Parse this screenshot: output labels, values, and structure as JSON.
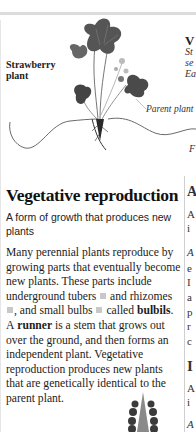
{
  "figure": {
    "plant_label_line1": "Strawberry",
    "plant_label_line2": "plant",
    "parent_label": "Parent plant",
    "icon": "strawberry-plant-illustration"
  },
  "right_peek": {
    "heading_char": "V",
    "italic_lines": [
      "St",
      "se",
      "Ea"
    ],
    "F": "F",
    "col_chars": [
      "A",
      "A",
      "i",
      "A",
      "e",
      "I",
      "a",
      "p",
      "r",
      "c",
      "I",
      "A",
      "i",
      "A"
    ]
  },
  "section": {
    "title": "Vegetative reproduction",
    "subtitle": "A form of growth that produces new plants",
    "body": {
      "p1": "Many perennial plants reproduce by growing parts that eventually become new plants. These parts include underground tubers",
      "p2": "and rhizomes",
      "p3": ", and small bulbs",
      "p4": "called",
      "bulbils": "bulbils",
      "p5": ". A",
      "runner": "runner",
      "p6": "is a stem that grows out over the ground, and then forms an independent plant. Vegetative reproduction produces new plants that are genetically identical to the parent plant."
    }
  },
  "colors": {
    "topbar": "#dcdcdc",
    "square_marker": "#c8c8c8",
    "divider": "#cfcfcf"
  }
}
